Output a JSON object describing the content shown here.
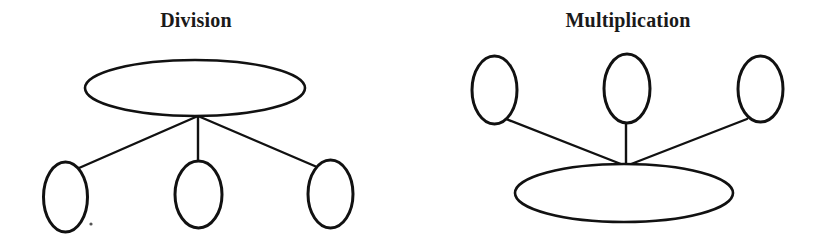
{
  "figure": {
    "background_color": "#ffffff",
    "stroke_color": "#111111",
    "text_color": "#1a1a1a",
    "width": 823,
    "height": 239
  },
  "diagrams": [
    {
      "id": "division",
      "title": "Division",
      "title_x": 196,
      "title_y": 27,
      "description": "One large ellipse on top connected by three straight lines to three small ellipses below",
      "hub": {
        "x": 198,
        "y": 116
      },
      "main_node": {
        "name": "division-whole-ellipse",
        "cx": 195,
        "cy": 88,
        "rx": 110,
        "ry": 28,
        "stroke_width": 2.6
      },
      "child_nodes": [
        {
          "name": "division-part-ellipse-left",
          "cx": 65.5,
          "cy": 197,
          "rx": 22,
          "ry": 35,
          "stroke_width": 3.0
        },
        {
          "name": "division-part-ellipse-middle",
          "cx": 198.5,
          "cy": 194.5,
          "rx": 23.5,
          "ry": 33.5,
          "stroke_width": 3.0
        },
        {
          "name": "division-part-ellipse-right",
          "cx": 330.5,
          "cy": 194,
          "rx": 22.5,
          "ry": 34,
          "stroke_width": 3.0
        }
      ],
      "edges": [
        {
          "name": "division-edge-left",
          "x1": 198,
          "y1": 116,
          "x2": 79,
          "y2": 168,
          "stroke_width": 2.4
        },
        {
          "name": "division-edge-middle",
          "x1": 198,
          "y1": 116,
          "x2": 198,
          "y2": 163,
          "stroke_width": 2.4
        },
        {
          "name": "division-edge-right",
          "x1": 198,
          "y1": 116,
          "x2": 317,
          "y2": 167,
          "stroke_width": 2.4
        }
      ],
      "speck": {
        "name": "division-scan-speck",
        "cx": 91,
        "cy": 224,
        "r": 1.6
      }
    },
    {
      "id": "multiplication",
      "title": "Multiplication",
      "title_x": 628,
      "title_y": 27,
      "description": "Three small ellipses on top connected by three straight lines down to one large ellipse below",
      "hub": {
        "x": 626,
        "y": 166
      },
      "main_node": {
        "name": "multiplication-product-ellipse",
        "cx": 624,
        "cy": 193,
        "rx": 109,
        "ry": 29,
        "stroke_width": 2.6
      },
      "child_nodes": [
        {
          "name": "multiplication-factor-ellipse-left",
          "cx": 494.5,
          "cy": 90,
          "rx": 22.5,
          "ry": 34,
          "stroke_width": 3.0
        },
        {
          "name": "multiplication-factor-ellipse-middle",
          "cx": 627,
          "cy": 88.5,
          "rx": 23,
          "ry": 34.5,
          "stroke_width": 3.0
        },
        {
          "name": "multiplication-factor-ellipse-right",
          "cx": 760.5,
          "cy": 89,
          "rx": 22.5,
          "ry": 33,
          "stroke_width": 3.0
        }
      ],
      "edges": [
        {
          "name": "multiplication-edge-left",
          "x1": 626,
          "y1": 166,
          "x2": 506,
          "y2": 119,
          "stroke_width": 2.4
        },
        {
          "name": "multiplication-edge-middle",
          "x1": 626,
          "y1": 166,
          "x2": 626,
          "y2": 122,
          "stroke_width": 2.4
        },
        {
          "name": "multiplication-edge-right",
          "x1": 626,
          "y1": 166,
          "x2": 747,
          "y2": 119,
          "stroke_width": 2.4
        }
      ]
    }
  ]
}
